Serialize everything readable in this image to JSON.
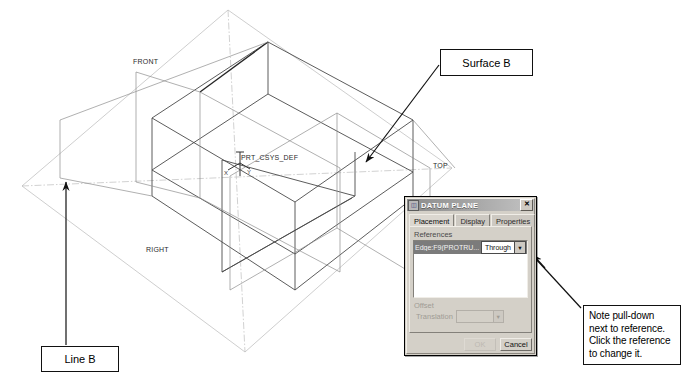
{
  "model": {
    "labels": {
      "front": "FRONT",
      "top": "TOP",
      "right": "RIGHT",
      "csys": "PRT_CSYS_DEF",
      "axis_x": "X",
      "axis_y": "Y",
      "axis_z": "Z"
    }
  },
  "callouts": {
    "surface_b": "Surface B",
    "line_b": "Line B",
    "note": "Note pull-down next to reference. Click the reference to change it."
  },
  "dialog": {
    "title": "DATUM PLANE",
    "title_icon": "datum-plane-icon",
    "close_label": "✕",
    "tabs": [
      {
        "label": "Placement",
        "active": true
      },
      {
        "label": "Display",
        "active": false
      },
      {
        "label": "Properties",
        "active": false
      }
    ],
    "references": {
      "group_label": "References",
      "row_text": "Edge:F9(PROTRU...",
      "constraint_value": "Through",
      "dropdown_icon": "chevron-down-icon"
    },
    "offset": {
      "group_label": "Offset",
      "translation_label": "Translation",
      "translation_value": "",
      "dropdown_icon": "chevron-down-icon"
    },
    "buttons": {
      "ok": "OK",
      "cancel": "Cancel"
    }
  },
  "colors": {
    "dialog_face": "#d4d0c8",
    "titlebar": "#8b8b8b",
    "selection": "#7b7b7b",
    "wireframe": "#4a4a4a",
    "datum": "#8e8e8e",
    "leader": "#111111"
  }
}
